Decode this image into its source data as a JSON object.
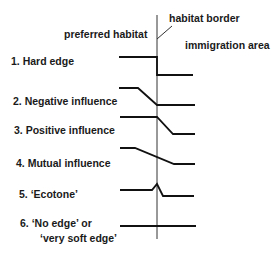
{
  "labels": {
    "habitat_border": "habitat border",
    "preferred_habitat": "preferred habitat",
    "immigration_area": "immigration area"
  },
  "edge_types": [
    {
      "label_lines": [
        "1. Hard edge"
      ],
      "profile": "hard-edge"
    },
    {
      "label_lines": [
        "2. Negative influence"
      ],
      "profile": "negative-influence"
    },
    {
      "label_lines": [
        "3. Positive influence"
      ],
      "profile": "positive-influence"
    },
    {
      "label_lines": [
        "4. Mutual influence"
      ],
      "profile": "mutual-influence"
    },
    {
      "label_lines": [
        "5. ‘Ecotone’"
      ],
      "profile": "ecotone"
    },
    {
      "label_lines": [
        "6. ‘No edge’ or",
        "‘very soft edge’"
      ],
      "profile": "no-edge"
    }
  ],
  "colors": {
    "line": "#111111",
    "text": "#1a1a1a",
    "background": "#ffffff"
  }
}
